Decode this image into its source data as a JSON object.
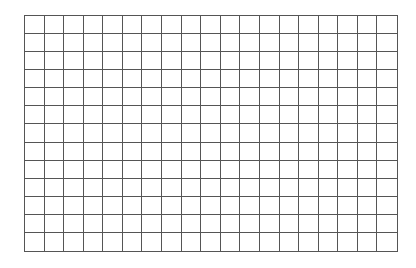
{
  "grid": {
    "rows": 13,
    "columns": 19,
    "line_color": "#555555",
    "background": "#ffffff"
  }
}
